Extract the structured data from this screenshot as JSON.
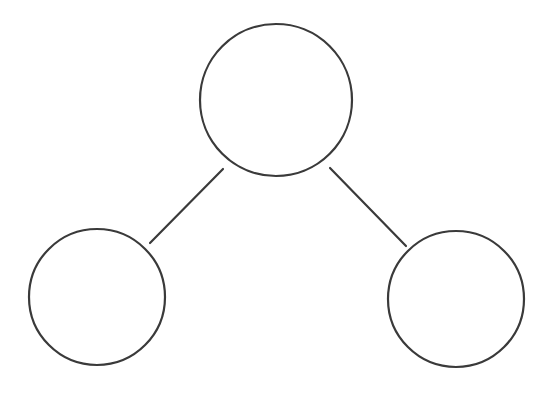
{
  "canvas": {
    "width": 552,
    "height": 393,
    "background_color": "#ffffff",
    "title": "Node Diagram"
  },
  "style": {
    "stroke_color": "#3a3a3a",
    "node_fill_color": "#ffffff",
    "node_stroke_width": 2.2,
    "edge_stroke_color": "#3a3a3a",
    "edge_stroke_width": 2.2
  },
  "graph": {
    "shape": "tree",
    "node_count": 3,
    "edge_count": 2,
    "nodes": [
      {
        "id": "root",
        "role": "root",
        "label": "",
        "cx": 276,
        "cy": 100,
        "r": 76
      },
      {
        "id": "child-left",
        "role": "child",
        "label": "",
        "cx": 97,
        "cy": 297,
        "r": 68
      },
      {
        "id": "child-right",
        "role": "child",
        "label": "",
        "cx": 456,
        "cy": 299,
        "r": 68
      }
    ],
    "edges": [
      {
        "id": "edge-root-left",
        "from": "root",
        "to": "child-left",
        "x1": 223,
        "y1": 169,
        "x2": 150,
        "y2": 243
      },
      {
        "id": "edge-root-right",
        "from": "root",
        "to": "child-right",
        "x1": 330,
        "y1": 168,
        "x2": 406,
        "y2": 246
      }
    ]
  }
}
